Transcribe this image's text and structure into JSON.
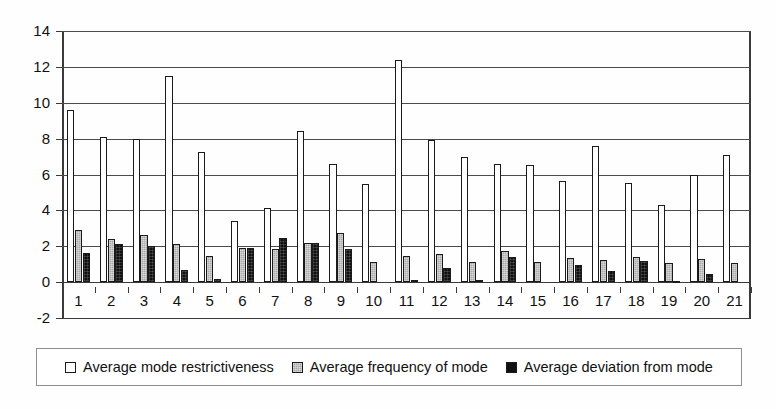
{
  "chart_data": {
    "type": "bar",
    "title": "",
    "xlabel": "",
    "ylabel": "",
    "ylim": [
      -2,
      14
    ],
    "yticks": [
      -2,
      0,
      2,
      4,
      6,
      8,
      10,
      12,
      14
    ],
    "ytick_labels": [
      "-2",
      "0",
      "2",
      "4",
      "6",
      "8",
      "10",
      "12",
      "14"
    ],
    "grid": true,
    "legend_position": "bottom",
    "categories": [
      "1",
      "2",
      "3",
      "4",
      "5",
      "6",
      "7",
      "8",
      "9",
      "10",
      "11",
      "12",
      "13",
      "14",
      "15",
      "16",
      "17",
      "18",
      "19",
      "20",
      "21"
    ],
    "series": [
      {
        "name": "Average mode restrictiveness",
        "color": "#ffffff",
        "values": [
          9.6,
          8.1,
          8.0,
          11.5,
          7.25,
          3.4,
          4.15,
          8.4,
          6.6,
          5.45,
          12.4,
          7.9,
          7.0,
          6.6,
          6.55,
          5.65,
          7.6,
          5.5,
          4.3,
          5.95,
          7.1
        ]
      },
      {
        "name": "Average frequency of mode",
        "color": "#a8a8a8",
        "values": [
          2.9,
          2.4,
          2.65,
          2.15,
          1.45,
          1.9,
          1.85,
          2.2,
          2.75,
          1.15,
          1.45,
          1.55,
          1.15,
          1.75,
          1.15,
          1.35,
          1.25,
          1.4,
          1.05,
          1.3,
          1.05
        ]
      },
      {
        "name": "Average deviation from mode",
        "color": "#101010",
        "values": [
          1.6,
          2.1,
          2.0,
          0.65,
          0.15,
          1.9,
          2.45,
          2.2,
          1.85,
          0.0,
          0.1,
          0.8,
          0.1,
          1.4,
          0.0,
          0.95,
          0.6,
          1.2,
          -0.05,
          0.45,
          0.0
        ]
      }
    ]
  }
}
